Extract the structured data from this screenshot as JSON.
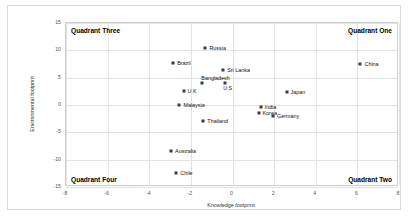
{
  "chart_data": {
    "type": "scatter",
    "title": "",
    "xlabel": "Knowledge footprint",
    "ylabel": "Environmental footprint",
    "xlim": [
      -8,
      8
    ],
    "ylim": [
      -15,
      15
    ],
    "xticks": [
      -8,
      -6,
      -4,
      -2,
      0,
      2,
      4,
      6,
      8
    ],
    "yticks": [
      -15,
      -10,
      -5,
      0,
      5,
      10,
      15
    ],
    "grid": true,
    "legend": "none",
    "marker_color": "#3b3b3b",
    "points": [
      {
        "label": "Russia",
        "x": -1.3,
        "y": 10.4,
        "label_side": "right"
      },
      {
        "label": "Brazil",
        "x": -2.85,
        "y": 7.7,
        "label_side": "right"
      },
      {
        "label": "China",
        "x": 6.15,
        "y": 7.5,
        "label_side": "right"
      },
      {
        "label": "Sri Lanka",
        "x": -0.45,
        "y": 6.4,
        "label_side": "right"
      },
      {
        "label": "Bangladesh",
        "x": -1.45,
        "y": 4.1,
        "label_side": "above-right"
      },
      {
        "label": "U.S",
        "x": -0.35,
        "y": 4.0,
        "label_side": "below"
      },
      {
        "label": "U.K",
        "x": -2.35,
        "y": 2.5,
        "label_side": "right"
      },
      {
        "label": "Japan",
        "x": 2.6,
        "y": 2.3,
        "label_side": "right"
      },
      {
        "label": "Malaysia",
        "x": -2.55,
        "y": 0.0,
        "label_side": "right"
      },
      {
        "label": "India",
        "x": 1.35,
        "y": -0.4,
        "label_side": "right"
      },
      {
        "label": "Korea",
        "x": 1.25,
        "y": -1.4,
        "label_side": "right"
      },
      {
        "label": "Germany",
        "x": 1.95,
        "y": -2.1,
        "label_side": "right"
      },
      {
        "label": "Thailand",
        "x": -1.4,
        "y": -2.9,
        "label_side": "right"
      },
      {
        "label": "Australia",
        "x": -2.95,
        "y": -8.5,
        "label_side": "right"
      },
      {
        "label": "Chile",
        "x": -2.7,
        "y": -12.4,
        "label_side": "right"
      }
    ],
    "annotations": [
      {
        "name": "quadrant-three",
        "text": "Quadrant Three"
      },
      {
        "name": "quadrant-one",
        "text": "Quadrant One"
      },
      {
        "name": "quadrant-four",
        "text": "Quadrant Four"
      },
      {
        "name": "quadrant-two",
        "text": "Quadrant Two"
      }
    ]
  }
}
